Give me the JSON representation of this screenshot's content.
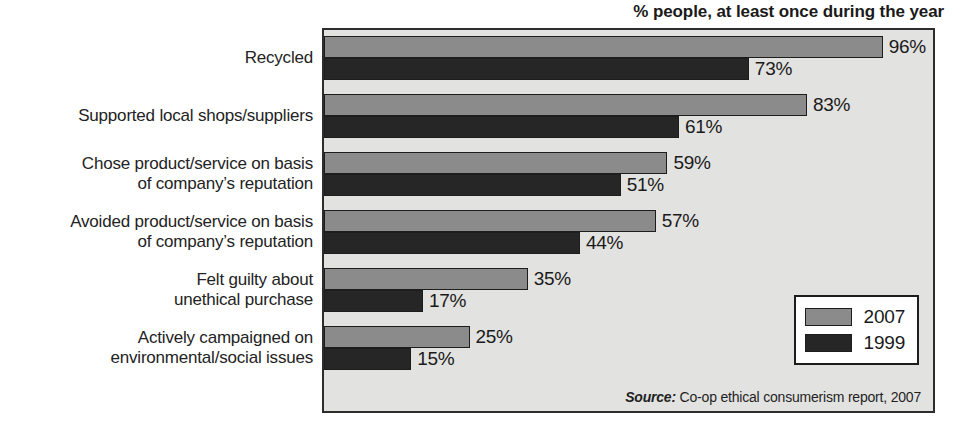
{
  "chart_data": {
    "type": "bar",
    "orientation": "horizontal",
    "title": "% people, at least once during the year",
    "xlabel": "",
    "ylabel": "",
    "xlim": [
      0,
      100
    ],
    "grid": false,
    "legend_position": "bottom-right",
    "categories": [
      "Recycled",
      "Supported local shops/suppliers",
      "Chose product/service on basis of company's reputation",
      "Avoided product/service on basis of company's reputation",
      "Felt guilty about unethical purchase",
      "Actively campaigned on environmental/social issues"
    ],
    "category_lines": [
      [
        "Recycled"
      ],
      [
        "Supported local shops/suppliers"
      ],
      [
        "Chose product/service on basis",
        "of company’s reputation"
      ],
      [
        "Avoided product/service on basis",
        "of company’s reputation"
      ],
      [
        "Felt guilty about",
        "unethical purchase"
      ],
      [
        "Actively campaigned on",
        "environmental/social issues"
      ]
    ],
    "series": [
      {
        "name": "2007",
        "color": "#8b8b8b",
        "values": [
          96,
          83,
          59,
          57,
          35,
          25
        ],
        "labels": [
          "96%",
          "83%",
          "59%",
          "57%",
          "35%",
          "25%"
        ]
      },
      {
        "name": "1999",
        "color": "#262626",
        "values": [
          73,
          61,
          51,
          44,
          17,
          15
        ],
        "labels": [
          "73%",
          "61%",
          "51%",
          "44%",
          "17%",
          "15%"
        ]
      }
    ],
    "annotations": {
      "source_prefix": "Source:",
      "source_text": "Co-op ethical consumerism report, 2007"
    }
  },
  "legend": {
    "entries": [
      {
        "label": "2007",
        "color": "#8b8b8b"
      },
      {
        "label": "1999",
        "color": "#262626"
      }
    ]
  },
  "colors": {
    "series_2007": "#8b8b8b",
    "series_1999": "#262626",
    "plot_background": "#e2e2e0",
    "axis_border": "#2d2d2d",
    "page_background": "#ffffff",
    "text": "#1a1a1a"
  }
}
